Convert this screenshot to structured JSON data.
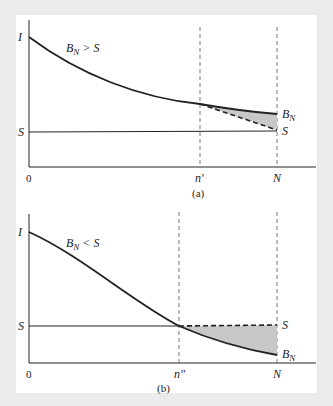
{
  "figure": {
    "background": "#ebebeb",
    "panel_background": "#ffffff",
    "line_color": "#222222",
    "shade_color": "#c8c8c8"
  },
  "panel_a": {
    "caption": "(a)",
    "condition": "B_N > S",
    "y_labels": {
      "top": "I",
      "middle": "S"
    },
    "x_labels": {
      "origin": "0",
      "split": "n'",
      "end": "N"
    },
    "end_labels": {
      "upper": "B_N",
      "lower": "S"
    }
  },
  "panel_b": {
    "caption": "(b)",
    "condition": "B_N < S",
    "y_labels": {
      "top": "I",
      "middle": "S"
    },
    "x_labels": {
      "origin": "0",
      "split": "n\"",
      "end": "N"
    },
    "end_labels": {
      "upper": "S",
      "lower": "B_N"
    }
  }
}
